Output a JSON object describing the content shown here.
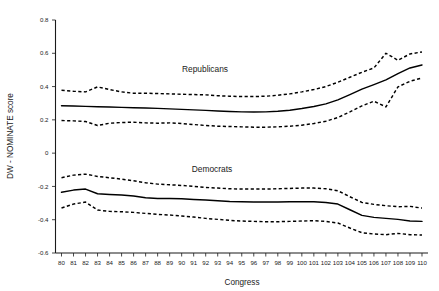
{
  "chart_data": {
    "type": "line",
    "title": "",
    "xlabel": "Congress",
    "ylabel": "DW - NOMINATE score",
    "xlim": [
      79.5,
      110.5
    ],
    "ylim": [
      -0.6,
      0.8
    ],
    "grid": false,
    "legend": "inline-annotations",
    "yticks": [
      "0.8",
      "0.6",
      "0.4",
      "0.2",
      "0",
      "-0.2",
      "-0.4",
      "-0.6"
    ],
    "ytick_values": [
      0.8,
      0.6,
      0.4,
      0.2,
      0,
      -0.2,
      -0.4,
      -0.6
    ],
    "x": [
      80,
      81,
      82,
      83,
      84,
      85,
      86,
      87,
      88,
      89,
      90,
      91,
      92,
      93,
      94,
      95,
      96,
      97,
      98,
      99,
      100,
      101,
      102,
      103,
      104,
      105,
      106,
      107,
      108,
      109,
      110
    ],
    "xticks": [
      "80",
      "81",
      "82",
      "83",
      "84",
      "85",
      "86",
      "87",
      "88",
      "89",
      "90",
      "91",
      "92",
      "93",
      "94",
      "95",
      "96",
      "97",
      "98",
      "99",
      "100",
      "101",
      "102",
      "103",
      "104",
      "105",
      "106",
      "107",
      "108",
      "109",
      "110"
    ],
    "annotations": [
      {
        "text": "Republicans",
        "x": 89.5,
        "y": 0.6
      },
      {
        "text": "Democrats",
        "x": 92.5,
        "y": -0.07
      }
    ],
    "series": [
      {
        "name": "Republicans",
        "style": "solid",
        "role": "mean",
        "values": [
          0.285,
          0.283,
          0.281,
          0.279,
          0.277,
          0.275,
          0.273,
          0.271,
          0.269,
          0.266,
          0.263,
          0.26,
          0.257,
          0.253,
          0.25,
          0.248,
          0.247,
          0.248,
          0.252,
          0.258,
          0.268,
          0.28,
          0.296,
          0.32,
          0.352,
          0.385,
          0.412,
          0.44,
          0.478,
          0.512,
          0.53
        ]
      },
      {
        "name": "Republicans upper CI",
        "style": "dashed",
        "role": "upper",
        "values": [
          0.378,
          0.372,
          0.368,
          0.398,
          0.382,
          0.368,
          0.36,
          0.36,
          0.358,
          0.356,
          0.354,
          0.352,
          0.35,
          0.345,
          0.342,
          0.34,
          0.34,
          0.342,
          0.348,
          0.356,
          0.368,
          0.382,
          0.4,
          0.426,
          0.456,
          0.486,
          0.512,
          0.6,
          0.558,
          0.596,
          0.608
        ]
      },
      {
        "name": "Republicans lower CI",
        "style": "dashed",
        "role": "lower",
        "values": [
          0.196,
          0.194,
          0.19,
          0.166,
          0.18,
          0.184,
          0.186,
          0.182,
          0.18,
          0.182,
          0.178,
          0.172,
          0.166,
          0.162,
          0.16,
          0.158,
          0.156,
          0.156,
          0.158,
          0.162,
          0.168,
          0.178,
          0.192,
          0.214,
          0.248,
          0.284,
          0.312,
          0.278,
          0.398,
          0.432,
          0.452
        ]
      },
      {
        "name": "Democrats",
        "style": "solid",
        "role": "mean",
        "values": [
          -0.235,
          -0.222,
          -0.216,
          -0.244,
          -0.248,
          -0.252,
          -0.258,
          -0.268,
          -0.272,
          -0.272,
          -0.274,
          -0.278,
          -0.282,
          -0.286,
          -0.29,
          -0.292,
          -0.294,
          -0.294,
          -0.294,
          -0.292,
          -0.292,
          -0.292,
          -0.296,
          -0.306,
          -0.34,
          -0.374,
          -0.386,
          -0.392,
          -0.398,
          -0.408,
          -0.41
        ]
      },
      {
        "name": "Democrats upper CI",
        "style": "dashed",
        "role": "upper",
        "values": [
          -0.148,
          -0.132,
          -0.126,
          -0.14,
          -0.148,
          -0.156,
          -0.166,
          -0.178,
          -0.186,
          -0.19,
          -0.194,
          -0.2,
          -0.206,
          -0.21,
          -0.214,
          -0.216,
          -0.216,
          -0.216,
          -0.214,
          -0.212,
          -0.21,
          -0.21,
          -0.214,
          -0.226,
          -0.262,
          -0.296,
          -0.308,
          -0.316,
          -0.322,
          -0.32,
          -0.33
        ]
      },
      {
        "name": "Democrats lower CI",
        "style": "dashed",
        "role": "lower",
        "values": [
          -0.33,
          -0.306,
          -0.294,
          -0.342,
          -0.35,
          -0.352,
          -0.356,
          -0.362,
          -0.368,
          -0.372,
          -0.378,
          -0.384,
          -0.392,
          -0.398,
          -0.404,
          -0.408,
          -0.41,
          -0.412,
          -0.412,
          -0.41,
          -0.408,
          -0.406,
          -0.41,
          -0.42,
          -0.45,
          -0.478,
          -0.486,
          -0.49,
          -0.482,
          -0.49,
          -0.492
        ]
      }
    ]
  }
}
